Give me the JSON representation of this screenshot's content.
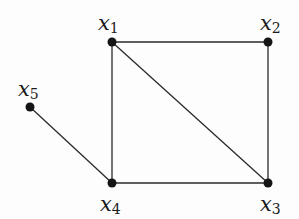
{
  "diagram": {
    "type": "undirected-graph",
    "nodes": [
      {
        "id": "x1",
        "base": "x",
        "sub": "1",
        "x": 112,
        "y": 42,
        "label_x": 98,
        "label_y": 30
      },
      {
        "id": "x2",
        "base": "x",
        "sub": "2",
        "x": 268,
        "y": 42,
        "label_x": 260,
        "label_y": 30
      },
      {
        "id": "x3",
        "base": "x",
        "sub": "3",
        "x": 268,
        "y": 183,
        "label_x": 260,
        "label_y": 211
      },
      {
        "id": "x4",
        "base": "x",
        "sub": "4",
        "x": 112,
        "y": 183,
        "label_x": 100,
        "label_y": 211
      },
      {
        "id": "x5",
        "base": "x",
        "sub": "5",
        "x": 30,
        "y": 107,
        "label_x": 18,
        "label_y": 96
      }
    ],
    "edges": [
      [
        "x1",
        "x2"
      ],
      [
        "x1",
        "x4"
      ],
      [
        "x1",
        "x3"
      ],
      [
        "x2",
        "x3"
      ],
      [
        "x4",
        "x3"
      ],
      [
        "x5",
        "x4"
      ]
    ]
  }
}
